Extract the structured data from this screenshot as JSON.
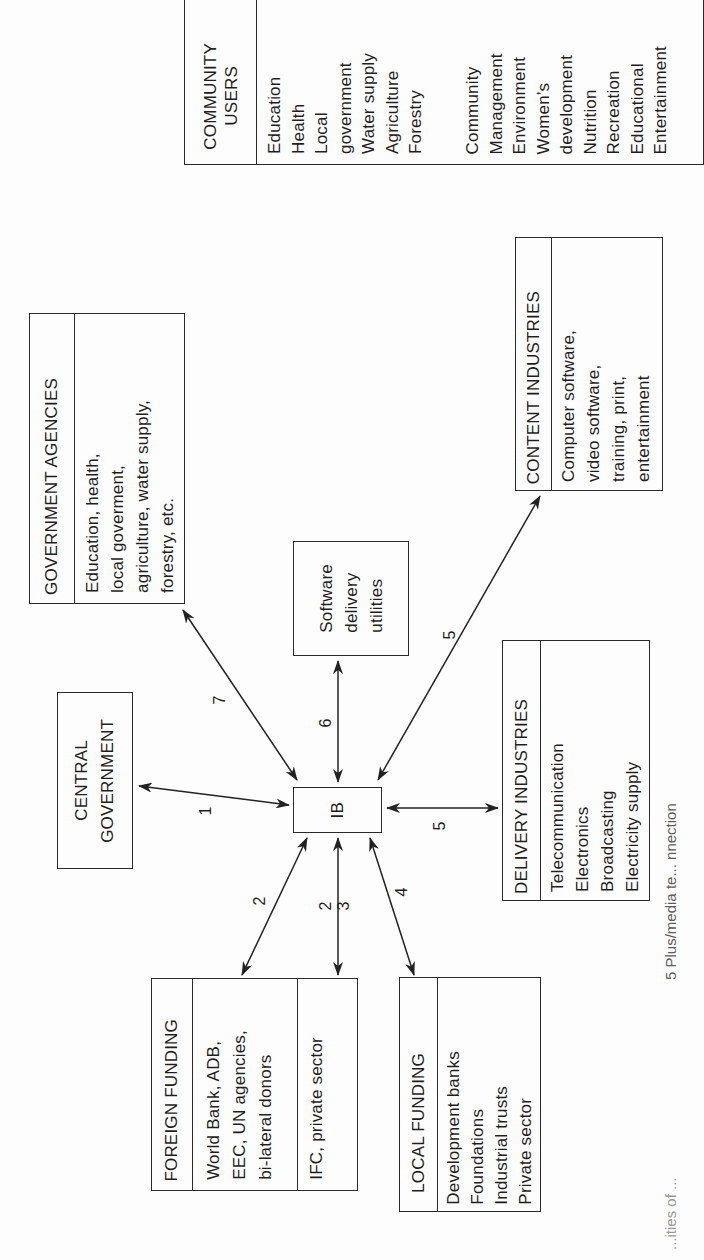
{
  "diagram": {
    "hub": {
      "label": "IB"
    },
    "nodes": {
      "community_users": {
        "title": "COMMUNITY\nUSERS",
        "col1": "Education\nHealth\nLocal\ngovernment\nWater supply\nAgriculture\nForestry",
        "col2": "Community\nManagement\nEnvironment\nWomen’s\ndevelopment\nNutrition\nRecreation\nEducational\nEntertainment"
      },
      "government_agencies": {
        "title": "GOVERNMENT AGENCIES",
        "body": "Education, health,\nlocal goverment,\nagriculture, water supply,\nforestry, etc."
      },
      "central_government": {
        "title": "CENTRAL\nGOVERNMENT"
      },
      "software_delivery": {
        "title": "Software\ndelivery\nutilities"
      },
      "content_industries": {
        "title": "CONTENT INDUSTRIES",
        "body": "Computer software,\nvideo software,\ntraining, print,\nentertainment"
      },
      "delivery_industries": {
        "title": "DELIVERY INDUSTRIES",
        "body": "Telecommunication\nElectronics\nBroadcasting\nElectricity supply"
      },
      "foreign_funding": {
        "title": "FOREIGN FUNDING",
        "body": "World Bank, ADB,\nEEC, UN agencies,\nbi-lateral donors",
        "body2": "IFC, private sector"
      },
      "local_funding": {
        "title": "LOCAL FUNDING",
        "body": "Development banks\nFoundations\nIndustrial trusts\nPrivate sector"
      }
    },
    "edges": [
      {
        "from": "IB",
        "to": "central_government",
        "label": "1"
      },
      {
        "from": "IB",
        "to": "foreign_funding",
        "label": "2"
      },
      {
        "from": "IB",
        "to": "foreign_funding_ifc",
        "label": "2  3"
      },
      {
        "from": "IB",
        "to": "local_funding",
        "label": "4"
      },
      {
        "from": "IB",
        "to": "delivery_industries",
        "label": "5"
      },
      {
        "from": "IB",
        "to": "content_industries",
        "label": "5"
      },
      {
        "from": "IB",
        "to": "software_delivery",
        "label": "6"
      },
      {
        "from": "IB",
        "to": "government_agencies",
        "label": "7"
      }
    ],
    "edge_labels": {
      "e1": "1",
      "e2": "2",
      "e2b": "2",
      "e3": "3",
      "e4": "4",
      "e5a": "5",
      "e5b": "5",
      "e6": "6",
      "e7": "7"
    },
    "captions": {
      "right": "5 Plus/media te... nnection",
      "right_lower": "...ities of ..."
    }
  }
}
